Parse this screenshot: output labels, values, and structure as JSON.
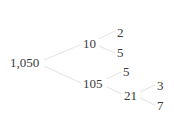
{
  "diagram": {
    "type": "factor-tree",
    "colors": {
      "text": "#3a3a3a",
      "edge": "#e6e6e6",
      "background": "#ffffff"
    },
    "nodes": [
      {
        "id": "n1050",
        "label": "1,050",
        "x": 10,
        "y": 56
      },
      {
        "id": "n10",
        "label": "10",
        "x": 83,
        "y": 37
      },
      {
        "id": "n2",
        "label": "2",
        "x": 117,
        "y": 26
      },
      {
        "id": "n5a",
        "label": "5",
        "x": 117,
        "y": 46
      },
      {
        "id": "n105",
        "label": "105",
        "x": 83,
        "y": 77
      },
      {
        "id": "n5b",
        "label": "5",
        "x": 123,
        "y": 65
      },
      {
        "id": "n21",
        "label": "21",
        "x": 124,
        "y": 89
      },
      {
        "id": "n3",
        "label": "3",
        "x": 157,
        "y": 79
      },
      {
        "id": "n7",
        "label": "7",
        "x": 157,
        "y": 99
      }
    ],
    "edges": [
      {
        "from": "n1050",
        "to": "n10"
      },
      {
        "from": "n1050",
        "to": "n105"
      },
      {
        "from": "n10",
        "to": "n2"
      },
      {
        "from": "n10",
        "to": "n5a"
      },
      {
        "from": "n105",
        "to": "n5b"
      },
      {
        "from": "n105",
        "to": "n21"
      },
      {
        "from": "n21",
        "to": "n3"
      },
      {
        "from": "n21",
        "to": "n7"
      }
    ]
  }
}
